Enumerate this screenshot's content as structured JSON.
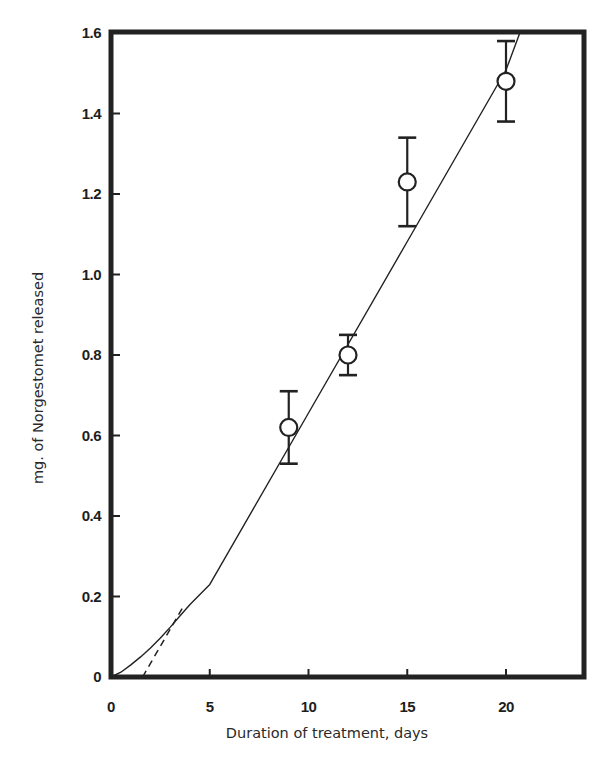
{
  "chart_data": {
    "type": "scatter",
    "title": "",
    "xlabel": "Duration of treatment, days",
    "ylabel": "mg. of Norgestomet released",
    "xlim": [
      0,
      24
    ],
    "ylim": [
      0,
      1.6
    ],
    "grid": false,
    "legend": null,
    "x_ticks": [
      0,
      5,
      10,
      15,
      20
    ],
    "x_tick_labels": [
      "0",
      "5",
      "10",
      "15",
      "20"
    ],
    "y_ticks": [
      0,
      0.2,
      0.4,
      0.6,
      0.8,
      1.0,
      1.2,
      1.4,
      1.6
    ],
    "y_tick_labels": [
      "0",
      "0.2",
      "0.4",
      "0.6",
      "0.8",
      "1.0",
      "1.2",
      "1.4",
      "1.6"
    ],
    "series": [
      {
        "name": "Observed release (mean ± error)",
        "marker": "open-circle",
        "x": [
          9,
          12,
          15,
          20
        ],
        "y": [
          0.62,
          0.8,
          1.23,
          1.48
        ],
        "error_upper": [
          0.71,
          0.85,
          1.34,
          1.58
        ],
        "error_lower": [
          0.53,
          0.75,
          1.12,
          1.38
        ]
      },
      {
        "name": "Fitted release curve",
        "style": "solid",
        "x": [
          0,
          0.5,
          1,
          1.5,
          2,
          2.5,
          3,
          3.5,
          4,
          5,
          10,
          15,
          20,
          20.7
        ],
        "y": [
          0,
          0.012,
          0.03,
          0.05,
          0.072,
          0.097,
          0.124,
          0.152,
          0.18,
          0.23,
          0.656,
          1.082,
          1.508,
          1.6
        ]
      },
      {
        "name": "Linear extrapolation",
        "style": "dashed",
        "x": [
          1.6,
          3.6
        ],
        "y": [
          0,
          0.17
        ]
      }
    ]
  },
  "axes": {
    "x_label": "Duration of treatment, days",
    "y_label": "mg. of Norgestomet released"
  }
}
